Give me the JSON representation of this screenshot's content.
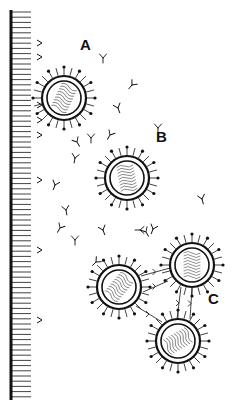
{
  "figure": {
    "colors": {
      "ink": "#111111",
      "background": "#ffffff"
    },
    "membrane": {
      "x": 11,
      "y_top": 10,
      "y_bottom": 400,
      "tick_spacing": 5.2,
      "tick_length": 20
    },
    "membrane_receptors_y": [
      43,
      57,
      105,
      120,
      135,
      180,
      250,
      320
    ],
    "labels": [
      {
        "id": "A",
        "text": "A",
        "x": 80,
        "y": 49
      },
      {
        "id": "B",
        "text": "B",
        "x": 156,
        "y": 141
      },
      {
        "id": "C",
        "text": "C",
        "x": 208,
        "y": 303
      }
    ],
    "virions": [
      {
        "id": "A",
        "cx": 64,
        "cy": 98,
        "r": 22
      },
      {
        "id": "B",
        "cx": 127,
        "cy": 178,
        "r": 22
      },
      {
        "id": "C1",
        "cx": 119,
        "cy": 287,
        "r": 22
      },
      {
        "id": "C2",
        "cx": 192,
        "cy": 265,
        "r": 22
      },
      {
        "id": "C3",
        "cx": 178,
        "cy": 341,
        "r": 22
      }
    ],
    "free_antibodies": [
      [
        103,
        58,
        0
      ],
      [
        132,
        85,
        40
      ],
      [
        118,
        108,
        -20
      ],
      [
        110,
        135,
        30
      ],
      [
        91,
        138,
        0
      ],
      [
        77,
        142,
        -30
      ],
      [
        75,
        158,
        10
      ],
      [
        55,
        185,
        20
      ],
      [
        66,
        210,
        -10
      ],
      [
        60,
        228,
        30
      ],
      [
        75,
        240,
        0
      ],
      [
        103,
        230,
        -20
      ],
      [
        96,
        262,
        45
      ],
      [
        146,
        232,
        -30
      ],
      [
        153,
        229,
        20
      ],
      [
        202,
        199,
        -15
      ],
      [
        140,
        230,
        90
      ],
      [
        158,
        128,
        0
      ]
    ],
    "bridging_antibodies": [
      [
        [
          141,
          276
        ],
        [
          170,
          268
        ]
      ],
      [
        [
          143,
          292
        ],
        [
          168,
          281
        ]
      ],
      [
        [
          136,
          306
        ],
        [
          162,
          322
        ]
      ],
      [
        [
          181,
          287
        ],
        [
          177,
          319
        ]
      ],
      [
        [
          192,
          288
        ],
        [
          190,
          319
        ]
      ]
    ]
  }
}
